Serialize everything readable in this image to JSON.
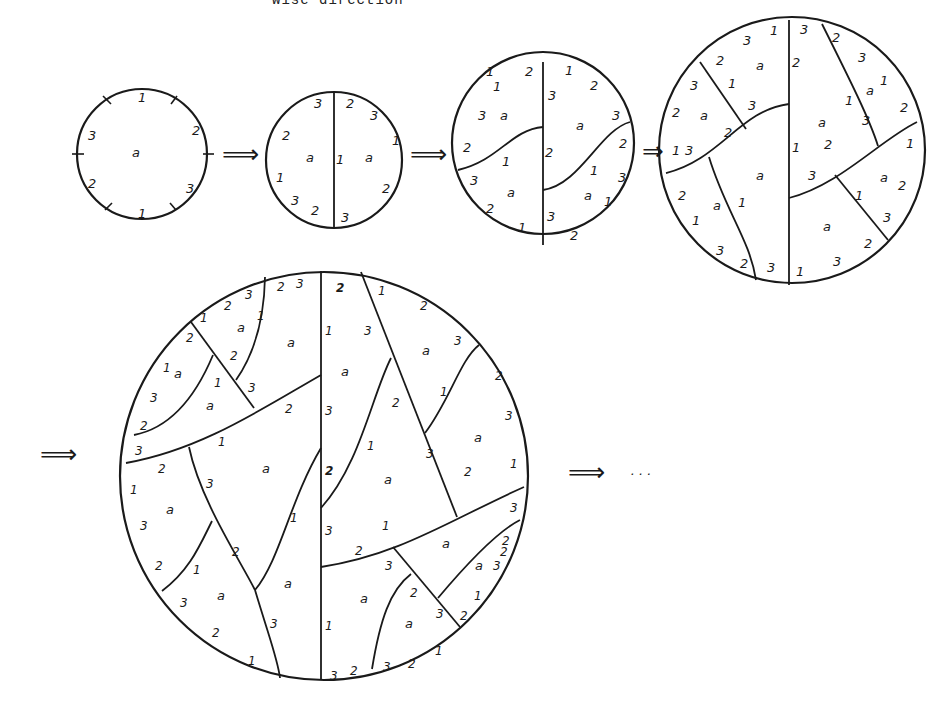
{
  "header": {
    "caption_fragment": "wise direction"
  },
  "diagram": {
    "arrows": [
      "⟹",
      "⟹",
      "⇒",
      "⟹",
      "⟹"
    ],
    "ellipsis": "· · ·",
    "face_label": "a",
    "stages": [
      {
        "id": 1,
        "edge_labels": [
          "1",
          "2",
          "3",
          "1",
          "2",
          "3"
        ],
        "faces": [
          "a"
        ]
      },
      {
        "id": 2,
        "edge_labels": [
          "3",
          "2",
          "3",
          "1",
          "2",
          "3",
          "2",
          "1",
          "1",
          "3",
          "2"
        ],
        "faces": [
          "a",
          "a"
        ]
      },
      {
        "id": 3,
        "edge_labels": [
          "1",
          "2",
          "3",
          "2",
          "1",
          "3",
          "2",
          "1",
          "1",
          "2",
          "3",
          "2",
          "3",
          "1",
          "2",
          "3",
          "1",
          "3",
          "a"
        ],
        "faces": [
          "a",
          "a",
          "a",
          "a"
        ]
      },
      {
        "id": 4,
        "edge_labels": [
          "1",
          "3",
          "2",
          "3",
          "2",
          "1",
          "2",
          "3",
          "1",
          "3",
          "1",
          "2",
          "3",
          "2",
          "3",
          "1",
          "2",
          "3",
          "2",
          "1",
          "3",
          "2",
          "1",
          "3",
          "2",
          "3",
          "1"
        ],
        "faces": [
          "a",
          "a",
          "a",
          "a",
          "a",
          "a",
          "a",
          "a"
        ]
      },
      {
        "id": 5,
        "faces": [
          "a",
          "a",
          "a",
          "a",
          "a",
          "a",
          "a",
          "a",
          "a",
          "a",
          "a",
          "a",
          "a",
          "a",
          "a",
          "a"
        ]
      }
    ]
  }
}
